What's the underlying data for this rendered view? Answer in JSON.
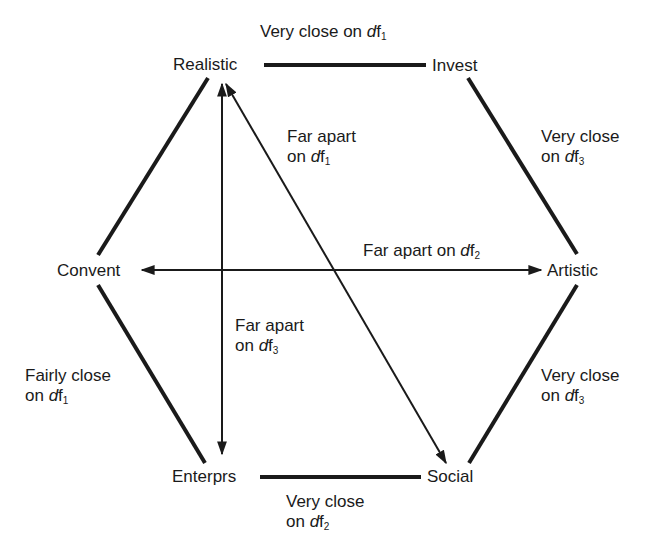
{
  "diagram": {
    "type": "hexagon-relationship",
    "nodes": [
      {
        "id": "realistic",
        "label": "Realistic"
      },
      {
        "id": "invest",
        "label": "Invest"
      },
      {
        "id": "artistic",
        "label": "Artistic"
      },
      {
        "id": "social",
        "label": "Social"
      },
      {
        "id": "enterprs",
        "label": "Enterprs"
      },
      {
        "id": "convent",
        "label": "Convent"
      }
    ],
    "edges": [
      {
        "from": "realistic",
        "to": "invest",
        "style": "thick",
        "relation": "Very close on",
        "factor": "df",
        "sub": "1"
      },
      {
        "from": "invest",
        "to": "artistic",
        "style": "thick",
        "relation": "Very close",
        "relation_line2": "on",
        "factor": "df",
        "sub": "3"
      },
      {
        "from": "artistic",
        "to": "social",
        "style": "thick",
        "relation": "Very close",
        "relation_line2": "on",
        "factor": "df",
        "sub": "3"
      },
      {
        "from": "enterprs",
        "to": "social",
        "style": "thick",
        "relation": "Very close",
        "relation_line2": "on",
        "factor": "df",
        "sub": "2"
      },
      {
        "from": "convent",
        "to": "enterprs",
        "style": "thick",
        "relation": "Fairly close",
        "relation_line2": "on",
        "factor": "df",
        "sub": "1"
      },
      {
        "from": "convent",
        "to": "realistic",
        "style": "thick",
        "relation": ""
      },
      {
        "from": "realistic",
        "to": "social",
        "style": "double-arrow",
        "relation": "Far apart",
        "relation_line2": "on",
        "factor": "df",
        "sub": "1"
      },
      {
        "from": "convent",
        "to": "artistic",
        "style": "double-arrow",
        "relation": "Far apart on",
        "factor": "df",
        "sub": "2"
      },
      {
        "from": "realistic",
        "to": "enterprs",
        "style": "double-arrow",
        "relation": "Far apart",
        "relation_line2": "on",
        "factor": "df",
        "sub": "3"
      }
    ]
  },
  "labels": {
    "top": {
      "text": "Very close on ",
      "df": "d",
      "f": "f",
      "sub": "1"
    },
    "far1": {
      "line1": "Far apart",
      "line2": "on ",
      "df": "d",
      "f": "f",
      "sub": "1"
    },
    "right_upper": {
      "line1": "Very close",
      "line2": "on ",
      "df": "d",
      "f": "f",
      "sub": "3"
    },
    "far2": {
      "text": "Far apart on ",
      "df": "d",
      "f": "f",
      "sub": "2"
    },
    "far3": {
      "line1": "Far apart",
      "line2": "on ",
      "df": "d",
      "f": "f",
      "sub": "3"
    },
    "left_lower": {
      "line1": "Fairly close",
      "line2": "on ",
      "df": "d",
      "f": "f",
      "sub": "1"
    },
    "right_lower": {
      "line1": "Very close",
      "line2": "on ",
      "df": "d",
      "f": "f",
      "sub": "3"
    },
    "bottom": {
      "line1": "Very close",
      "line2": "on ",
      "df": "d",
      "f": "f",
      "sub": "2"
    }
  },
  "colors": {
    "ink": "#1a1a1a",
    "background": "#ffffff"
  }
}
